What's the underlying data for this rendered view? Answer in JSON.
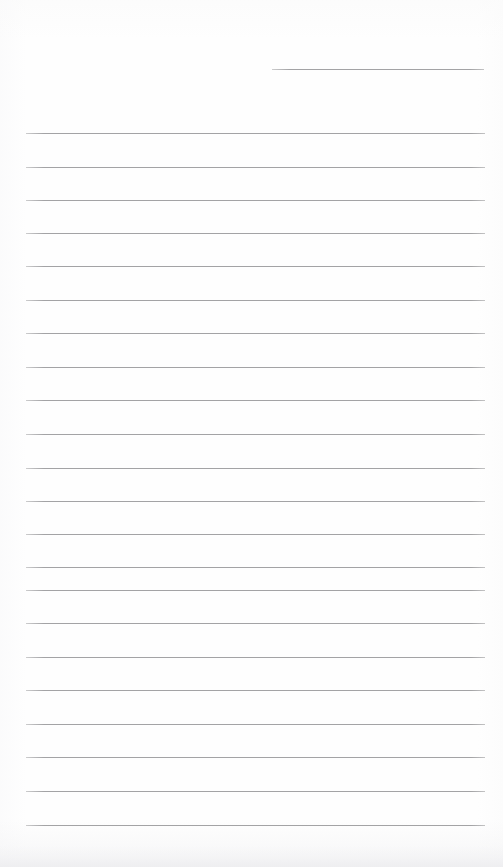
{
  "page": {
    "kind": "scanned-lined-notepad-page",
    "width": 503,
    "height": 867,
    "background_color": "#fefefe",
    "has_text": false,
    "has_handwriting": false,
    "visible_text": ""
  },
  "ruling": {
    "line_color": "#9c9c9e",
    "line_thickness_px": 1,
    "line_count": 23,
    "full_line_left_x": 26,
    "full_line_right_x": 485,
    "average_spacing_px": 33.6,
    "margin_line_present": false,
    "top_partial_line": {
      "left_x": 272,
      "right_x": 484,
      "y": 69,
      "note": "short rule at top-right only"
    },
    "lines": [
      {
        "y": 69,
        "x": 272,
        "width": 212
      },
      {
        "y": 133,
        "x": 26,
        "width": 459
      },
      {
        "y": 167,
        "x": 26,
        "width": 459
      },
      {
        "y": 200,
        "x": 26,
        "width": 459
      },
      {
        "y": 233,
        "x": 26,
        "width": 459
      },
      {
        "y": 266,
        "x": 26,
        "width": 459
      },
      {
        "y": 300,
        "x": 26,
        "width": 459
      },
      {
        "y": 333,
        "x": 26,
        "width": 459
      },
      {
        "y": 367,
        "x": 26,
        "width": 459
      },
      {
        "y": 400,
        "x": 26,
        "width": 459
      },
      {
        "y": 434,
        "x": 26,
        "width": 459
      },
      {
        "y": 468,
        "x": 26,
        "width": 459
      },
      {
        "y": 501,
        "x": 26,
        "width": 459
      },
      {
        "y": 534,
        "x": 26,
        "width": 459
      },
      {
        "y": 567,
        "x": 26,
        "width": 459
      },
      {
        "y": 590,
        "x": 26,
        "width": 459
      },
      {
        "y": 623,
        "x": 26,
        "width": 459
      },
      {
        "y": 657,
        "x": 26,
        "width": 459
      },
      {
        "y": 690,
        "x": 26,
        "width": 459
      },
      {
        "y": 724,
        "x": 26,
        "width": 459
      },
      {
        "y": 757,
        "x": 26,
        "width": 459
      },
      {
        "y": 791,
        "x": 26,
        "width": 459
      },
      {
        "y": 825,
        "x": 26,
        "width": 459
      }
    ]
  }
}
